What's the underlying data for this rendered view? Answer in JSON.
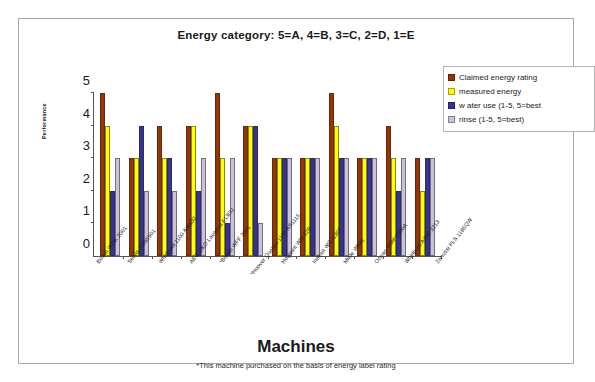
{
  "chart_data": {
    "type": "bar",
    "title": "Energy category: 5=A, 4=B, 3=C, 2=D, 1=E",
    "xlabel": "Machines",
    "ylabel": "Performance",
    "footnote": "*This machine purchased on the basis of energy label rating",
    "ylim": [
      0,
      5
    ],
    "yticks": [
      0,
      1,
      2,
      3,
      4,
      5
    ],
    "grid": false,
    "legend_position": "top-right",
    "categories": [
      "Bosch WOK 2001",
      "Servis (0995901",
      "Whirlpool 1100 AW932",
      "AEG OKO Lavamat 6130U",
      "*Bosch WFF 2001",
      "*Hoover Quattro 1100 AS1115",
      "Hotpoint WM 52P",
      "Indesit WG1130T",
      "Miele W842",
      "Ocean WMP1000A",
      "Whirlpool AWM 3213",
      "Zanussi FLS 1185QW"
    ],
    "series": [
      {
        "name": "Claimed energy rating",
        "color": "#993300",
        "values": [
          5,
          3,
          4,
          4,
          5,
          4,
          3,
          3,
          5,
          3,
          4,
          3
        ]
      },
      {
        "name": "measured energy",
        "color": "#FFFF00",
        "values": [
          4,
          3,
          3,
          4,
          3,
          4,
          3,
          3,
          4,
          3,
          3,
          2
        ]
      },
      {
        "name": "w ater use (1-5, 5=best",
        "color": "#333399",
        "values": [
          2,
          4,
          3,
          2,
          1,
          4,
          3,
          3,
          3,
          3,
          2,
          3
        ]
      },
      {
        "name": "rinse (1-5, 5=best)",
        "color": "#CCC0DA",
        "values": [
          3,
          2,
          2,
          3,
          3,
          1,
          3,
          3,
          3,
          3,
          3,
          3
        ]
      }
    ]
  }
}
